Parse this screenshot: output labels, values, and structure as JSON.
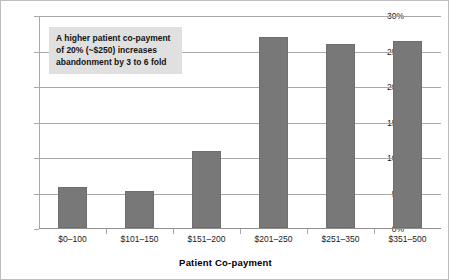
{
  "chart_data": {
    "type": "bar",
    "title": "",
    "xlabel": "Patient Co-payment",
    "ylabel": "",
    "categories": [
      "$0–100",
      "$101–150",
      "$151–200",
      "$201–250",
      "$251–350",
      "$351–500"
    ],
    "values": [
      5.8,
      5.2,
      10.8,
      26.9,
      25.9,
      26.4
    ],
    "ylim": [
      0,
      30
    ],
    "ytick_values": [
      0,
      5,
      10,
      15,
      20,
      25,
      30
    ],
    "ytick_labels": [
      "0%",
      "5%",
      "10%",
      "15%",
      "20%",
      "25%",
      "30%"
    ],
    "grid": true,
    "legend": "none",
    "series_name": "Abandonment rate",
    "bar_color": "#787878",
    "annotations": [
      {
        "text": "A higher patient co-payment of 20% (~$250) increases abandonment by 3 to 6 fold",
        "lines": [
          "A higher patient co-payment",
          "of 20% (~$250) increases",
          "abandonment by 3 to 6 fold"
        ],
        "background": "#e0e0e0",
        "position": "top-left"
      }
    ]
  }
}
